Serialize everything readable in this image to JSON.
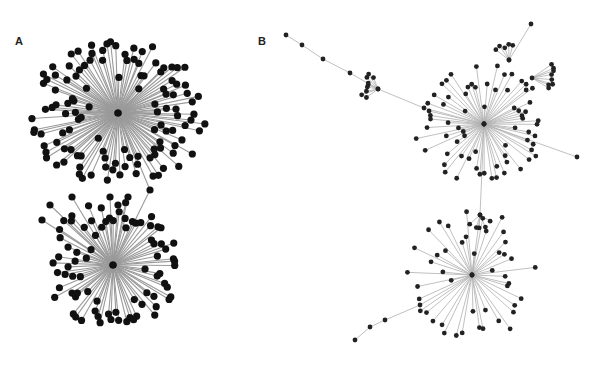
{
  "figure": {
    "panels": [
      {
        "id": "A",
        "label": "A",
        "label_pos": [
          15,
          42
        ],
        "node_radius": 3.6,
        "node_color": "#111111",
        "edge_color": "#9a9a9a",
        "hubs": [
          {
            "x": 118,
            "y": 113,
            "children": 120,
            "rmin": 28,
            "rmax": 92,
            "spread": [
              0,
              360
            ],
            "yscale": 0.78
          },
          {
            "x": 113,
            "y": 265,
            "children": 80,
            "rmin": 25,
            "rmax": 68,
            "spread": [
              0,
              360
            ],
            "yscale": 0.95
          }
        ],
        "bridge": [
          [
            118,
            113
          ],
          [
            150,
            190
          ],
          [
            113,
            265
          ]
        ],
        "extra_nodes": [
          [
            72,
            197
          ],
          [
            110,
            197
          ],
          [
            118,
            205
          ],
          [
            128,
            197
          ],
          [
            50,
            205
          ],
          [
            42,
            220
          ]
        ]
      },
      {
        "id": "B",
        "label": "B",
        "label_pos": [
          258,
          42
        ],
        "node_radius": 2.4,
        "node_color": "#222222",
        "edge_color": "#b0b0b0",
        "hubs": [
          {
            "x": 484,
            "y": 124,
            "children": 70,
            "rmin": 18,
            "rmax": 70,
            "spread": [
              0,
              360
            ],
            "yscale": 0.85
          },
          {
            "x": 472,
            "y": 275,
            "children": 45,
            "rmin": 18,
            "rmax": 65,
            "spread": [
              0,
              360
            ],
            "yscale": 1.05
          },
          {
            "x": 378,
            "y": 89,
            "children": 9,
            "rmin": 8,
            "rmax": 18,
            "spread": [
              140,
              260
            ],
            "yscale": 1.0
          },
          {
            "x": 480,
            "y": 215,
            "children": 5,
            "rmin": 8,
            "rmax": 14,
            "spread": [
              20,
              160
            ],
            "yscale": 1.0
          },
          {
            "x": 532,
            "y": 78,
            "children": 8,
            "rmin": 14,
            "rmax": 24,
            "spread": [
              -40,
              40
            ],
            "yscale": 1.0
          },
          {
            "x": 509,
            "y": 60,
            "children": 5,
            "rmin": 10,
            "rmax": 18,
            "spread": [
              -150,
              -70
            ],
            "yscale": 1.0
          }
        ],
        "chains": [
          [
            [
              286,
              35
            ],
            [
              302,
              45
            ],
            [
              323,
              59
            ],
            [
              350,
              73
            ],
            [
              378,
              89
            ],
            [
              424,
              108
            ],
            [
              484,
              124
            ]
          ],
          [
            [
              484,
              124
            ],
            [
              480,
              215
            ],
            [
              472,
              275
            ]
          ],
          [
            [
              472,
              275
            ],
            [
              420,
              305
            ],
            [
              385,
              320
            ],
            [
              370,
              327
            ],
            [
              355,
              340
            ]
          ],
          [
            [
              509,
              60
            ],
            [
              531,
              24
            ]
          ],
          [
            [
              484,
              124
            ],
            [
              577,
              157
            ]
          ]
        ]
      }
    ]
  }
}
